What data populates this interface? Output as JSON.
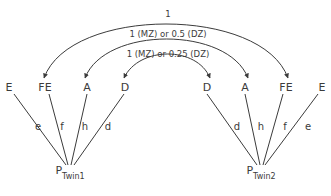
{
  "diagram": {
    "stroke_color": "#3b3b3b",
    "background": "#ffffff",
    "nodes": [
      {
        "id": "E-left",
        "label": "E",
        "x": 9,
        "y": 87
      },
      {
        "id": "FE-left",
        "label": "FE",
        "x": 45,
        "y": 87
      },
      {
        "id": "A-left",
        "label": "A",
        "x": 87,
        "y": 87
      },
      {
        "id": "D-left",
        "label": "D",
        "x": 125,
        "y": 87
      },
      {
        "id": "D-right",
        "label": "D",
        "x": 207,
        "y": 87
      },
      {
        "id": "A-right",
        "label": "A",
        "x": 245,
        "y": 87
      },
      {
        "id": "FE-right",
        "label": "FE",
        "x": 286,
        "y": 87
      },
      {
        "id": "E-right",
        "label": "E",
        "x": 322,
        "y": 87
      }
    ],
    "phenotypes": [
      {
        "id": "p-twin1",
        "letter": "P",
        "subscript": "Twin1",
        "x": 70,
        "y": 171
      },
      {
        "id": "p-twin2",
        "letter": "P",
        "subscript": "Twin2",
        "x": 261,
        "y": 171
      }
    ],
    "path_coefficients": [
      {
        "id": "e-left",
        "label": "e",
        "x": 38,
        "y": 127,
        "from": "E-left",
        "to": "p-twin1"
      },
      {
        "id": "f-left",
        "label": "f",
        "x": 62,
        "y": 127,
        "from": "FE-left",
        "to": "p-twin1"
      },
      {
        "id": "h-left",
        "label": "h",
        "x": 85,
        "y": 127,
        "from": "A-left",
        "to": "p-twin1"
      },
      {
        "id": "d-left",
        "label": "d",
        "x": 108,
        "y": 127,
        "from": "D-left",
        "to": "p-twin1"
      },
      {
        "id": "d-right",
        "label": "d",
        "x": 237,
        "y": 127,
        "from": "D-right",
        "to": "p-twin2"
      },
      {
        "id": "h-right",
        "label": "h",
        "x": 261,
        "y": 127,
        "from": "A-right",
        "to": "p-twin2"
      },
      {
        "id": "f-right",
        "label": "f",
        "x": 285,
        "y": 127,
        "from": "FE-right",
        "to": "p-twin2"
      },
      {
        "id": "e-right",
        "label": "e",
        "x": 308,
        "y": 127,
        "from": "E-right",
        "to": "p-twin2"
      }
    ],
    "correlation_arcs": [
      {
        "id": "arc-fe",
        "label": "1",
        "label_x": 168,
        "label_y": 14,
        "from": "FE-left",
        "to": "FE-right"
      },
      {
        "id": "arc-a",
        "label": "1 (MZ) or 0.5 (DZ)",
        "label_x": 168,
        "label_y": 34,
        "from": "A-left",
        "to": "A-right"
      },
      {
        "id": "arc-d",
        "label": "1 (MZ) or 0.25 (DZ)",
        "label_x": 168,
        "label_y": 54,
        "from": "D-left",
        "to": "D-right"
      }
    ]
  }
}
